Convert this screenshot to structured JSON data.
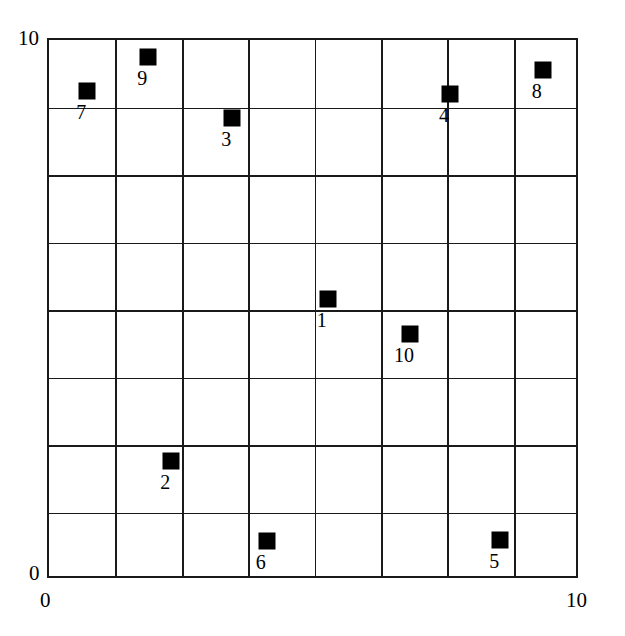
{
  "chart_data": {
    "type": "scatter",
    "title": "",
    "xlabel": "",
    "ylabel": "",
    "xlim": [
      0,
      10
    ],
    "ylim": [
      0,
      10
    ],
    "grid": true,
    "grid_step": 1.25,
    "legend": "none",
    "marker": "filled-square",
    "marker_color": "#000000",
    "axis_ticks": {
      "x": [
        "0",
        "10"
      ],
      "y": [
        "0",
        "10"
      ]
    },
    "points": [
      {
        "label": "1",
        "x": 5.25,
        "y": 5.2
      },
      {
        "label": "2",
        "x": 2.3,
        "y": 2.2
      },
      {
        "label": "3",
        "x": 3.45,
        "y": 8.55
      },
      {
        "label": "4",
        "x": 7.55,
        "y": 9.0
      },
      {
        "label": "5",
        "x": 8.5,
        "y": 0.75
      },
      {
        "label": "6",
        "x": 4.1,
        "y": 0.73
      },
      {
        "label": "7",
        "x": 0.72,
        "y": 9.05
      },
      {
        "label": "8",
        "x": 9.3,
        "y": 9.45
      },
      {
        "label": "9",
        "x": 1.87,
        "y": 9.68
      },
      {
        "label": "10",
        "x": 6.8,
        "y": 4.55
      }
    ]
  },
  "axes": {
    "y_max": "10",
    "y_min": "0",
    "x_min": "0",
    "x_max": "10"
  }
}
